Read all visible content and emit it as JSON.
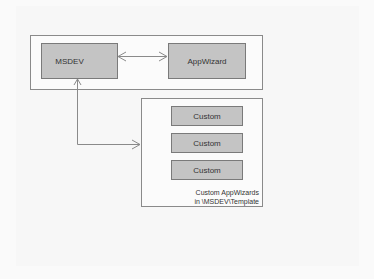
{
  "diagram": {
    "nodes": {
      "msdev": "MSDEV",
      "appwizard": "AppWizard",
      "custom": [
        "Custom",
        "Custom",
        "Custom"
      ]
    },
    "container_caption": [
      "Custom AppWizards",
      "in \\MSDEV\\Template"
    ],
    "connections": [
      {
        "from": "MSDEV",
        "to": "AppWizard",
        "direction": "bidirectional"
      },
      {
        "from": "MSDEV",
        "to": "Custom AppWizards",
        "direction": "bidirectional"
      }
    ],
    "colors": {
      "box_fill": "#c4c4c4",
      "border": "#7a7a7a",
      "arrow": "#8a8a8a"
    }
  }
}
